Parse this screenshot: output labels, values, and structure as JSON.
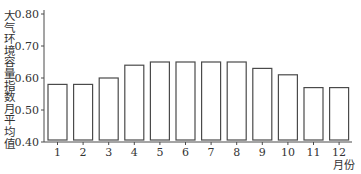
{
  "chart_data": {
    "type": "bar",
    "title": "",
    "xlabel": "月份",
    "ylabel": "大气环境容量指数月平均值",
    "categories": [
      "1",
      "2",
      "3",
      "4",
      "5",
      "6",
      "7",
      "8",
      "9",
      "10",
      "11",
      "12"
    ],
    "values": [
      0.58,
      0.58,
      0.6,
      0.64,
      0.65,
      0.65,
      0.65,
      0.65,
      0.63,
      0.61,
      0.57,
      0.57
    ],
    "ylim": [
      0.4,
      0.8
    ],
    "yticks": [
      "0.40",
      "0.50",
      "0.60",
      "0.70",
      "0.80"
    ],
    "grid": false,
    "legend": null,
    "bar_fill": "#ffffff",
    "bar_stroke": "#4a4a4a"
  }
}
